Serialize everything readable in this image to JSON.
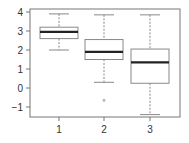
{
  "chart_data": {
    "type": "box",
    "title": "",
    "xlabel": "",
    "ylabel": "",
    "categories": [
      "1",
      "2",
      "3"
    ],
    "ylim": [
      -1.5,
      4.1
    ],
    "yticks": [
      -1,
      0,
      1,
      2,
      3,
      4
    ],
    "ytick_labels": [
      "−1",
      "0",
      "1",
      "2",
      "3",
      "4"
    ],
    "grid": false,
    "legend": null,
    "boxes": [
      {
        "label": "1",
        "whisker_low": 2.0,
        "q1": 2.6,
        "median": 2.95,
        "q3": 3.2,
        "whisker_high": 3.9,
        "outliers": []
      },
      {
        "label": "2",
        "whisker_low": 0.3,
        "q1": 1.5,
        "median": 1.9,
        "q3": 2.55,
        "whisker_high": 3.85,
        "outliers": [
          -0.65
        ]
      },
      {
        "label": "3",
        "whisker_low": -1.4,
        "q1": 0.25,
        "median": 1.35,
        "q3": 2.05,
        "whisker_high": 3.85,
        "outliers": []
      }
    ]
  },
  "colors": {
    "frame": "#777777",
    "box": "#888888",
    "median": "#222222",
    "whisker": "#888888",
    "text": "#333333"
  }
}
